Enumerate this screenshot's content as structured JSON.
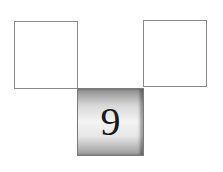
{
  "diagram": {
    "boxes": [
      {
        "position": "top-left",
        "label": ""
      },
      {
        "position": "top-right",
        "label": ""
      },
      {
        "position": "bottom-middle",
        "label": "9"
      }
    ]
  }
}
